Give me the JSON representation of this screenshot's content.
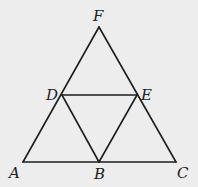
{
  "diagram": {
    "type": "geometry",
    "colors": {
      "background": "#ededed",
      "stroke": "#1e1e1e",
      "label": "#222222"
    },
    "points": {
      "A": {
        "label": "A",
        "x": 23,
        "y": 162
      },
      "B": {
        "label": "B",
        "x": 99,
        "y": 162
      },
      "C": {
        "label": "C",
        "x": 176,
        "y": 162
      },
      "D": {
        "label": "D",
        "x": 62,
        "y": 95
      },
      "E": {
        "label": "E",
        "x": 137,
        "y": 95
      },
      "F": {
        "label": "F",
        "x": 99,
        "y": 27
      }
    },
    "segments": [
      [
        "A",
        "F"
      ],
      [
        "F",
        "C"
      ],
      [
        "A",
        "C"
      ],
      [
        "D",
        "E"
      ],
      [
        "D",
        "B"
      ],
      [
        "E",
        "B"
      ]
    ],
    "labels": {
      "A": "A",
      "B": "B",
      "C": "C",
      "D": "D",
      "E": "E",
      "F": "F"
    }
  }
}
